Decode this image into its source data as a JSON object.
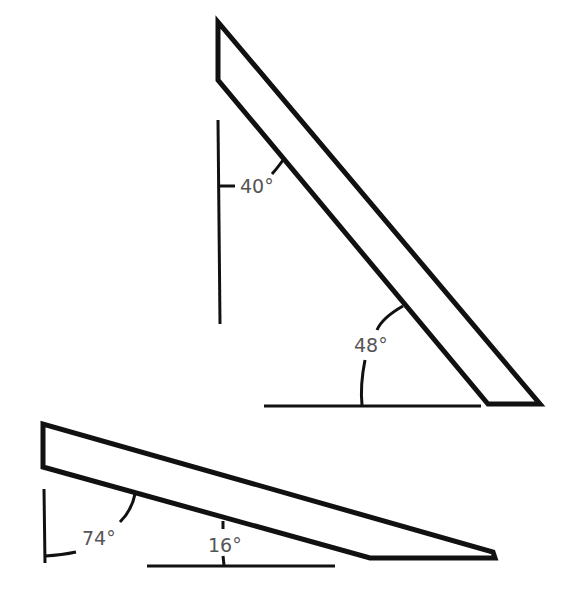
{
  "diagram": {
    "colors": {
      "stroke": "#111111",
      "label": "#555555",
      "background": "#ffffff"
    },
    "upper_board": {
      "angle_to_vertical_label": "40°",
      "angle_to_horizontal_label": "48°"
    },
    "lower_board": {
      "angle_to_vertical_label": "74°",
      "angle_to_horizontal_label": "16°"
    }
  }
}
